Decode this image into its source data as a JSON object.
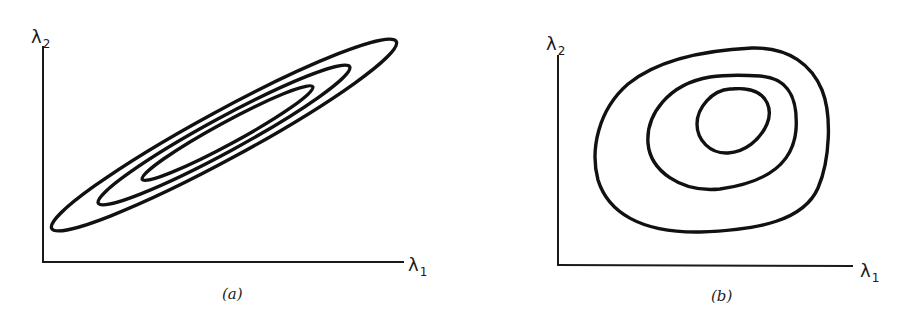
{
  "figure": {
    "panels": [
      {
        "id": "a",
        "caption": "(a)",
        "x_axis_label": "λ",
        "x_axis_subscript": "1",
        "y_axis_label": "λ",
        "y_axis_subscript": "2",
        "description": "Three nested, elongated elliptical contours tilted along a positive diagonal (strongly correlated parameters)",
        "contour_count": 3
      },
      {
        "id": "b",
        "caption": "(b)",
        "x_axis_label": "λ",
        "x_axis_subscript": "1",
        "y_axis_label": "λ",
        "y_axis_subscript": "2",
        "description": "Three nested, roughly circular/egg-shaped contours with innermost offset toward upper right",
        "contour_count": 3
      }
    ]
  }
}
